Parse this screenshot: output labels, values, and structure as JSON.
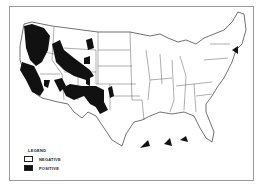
{
  "map": {
    "region": "Contiguous United States",
    "colors": {
      "positive": "#111111",
      "negative": "#ffffff",
      "border": "#333333",
      "frame": "#9a9a9a"
    }
  },
  "legend": {
    "title": "LEGEND",
    "items": [
      {
        "label": "NEGATIVE",
        "fill": "#ffffff"
      },
      {
        "label": "POSITIVE",
        "fill": "#111111"
      }
    ]
  }
}
